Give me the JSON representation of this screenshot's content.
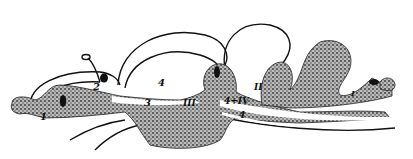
{
  "figure": {
    "labels": {
      "l1": "1",
      "l2": "2",
      "l3": "3",
      "l4_upper": "4",
      "l4_lower": "4",
      "lIII": "III",
      "lII": "II",
      "l4IV": "4+IV",
      "lI": "I"
    },
    "colors": {
      "ink": "#111111",
      "stipple": "#6e6e6e",
      "background": "#ffffff"
    }
  }
}
